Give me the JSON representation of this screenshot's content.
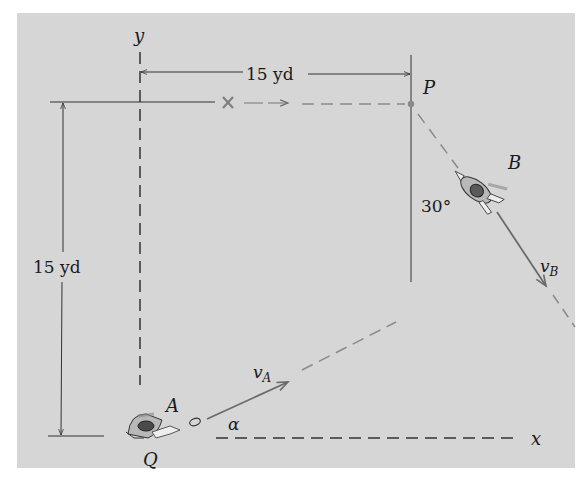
{
  "diagram": {
    "axes": {
      "x_label": "x",
      "y_label": "y"
    },
    "dimensions": {
      "horizontal": "15 yd",
      "vertical": "15 yd"
    },
    "points": {
      "P": "P",
      "Q": "Q",
      "A": "A",
      "B": "B"
    },
    "vectors": {
      "vA": {
        "base": "v",
        "sub": "A"
      },
      "vB": {
        "base": "v",
        "sub": "B"
      }
    },
    "angles": {
      "alpha": "α",
      "B_angle": "30°"
    },
    "markers": {
      "intercept": "×"
    },
    "colors": {
      "background": "#d6d6d6",
      "ink": "#1a1a1a",
      "path_gray": "#7f7f7f"
    }
  }
}
